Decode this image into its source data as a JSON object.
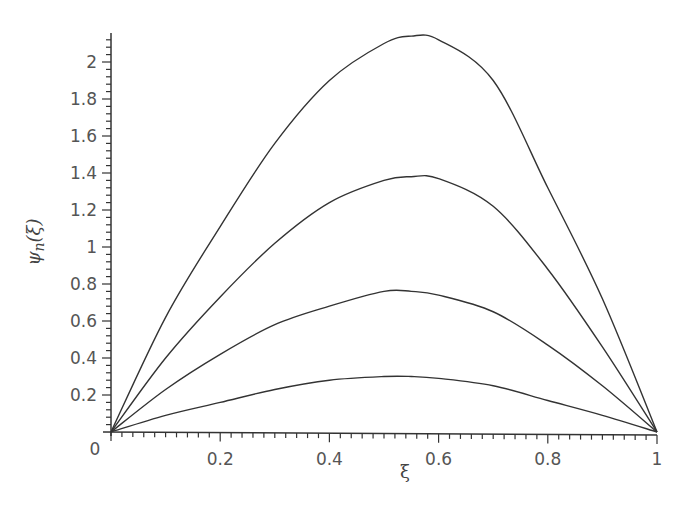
{
  "chart_data": {
    "type": "line",
    "title": "",
    "xlabel": "ξ",
    "ylabel": "ψn(ξ)",
    "xlim": [
      0,
      1
    ],
    "ylim": [
      0,
      2.2
    ],
    "grid": false,
    "legend": null,
    "x_ticks": [
      0,
      0.2,
      0.4,
      0.6,
      0.8,
      1
    ],
    "x_tick_labels": [
      "0",
      "0.2",
      "0.4",
      "0.6",
      "0.8",
      "1"
    ],
    "y_ticks": [
      0.2,
      0.4,
      0.6,
      0.8,
      1,
      1.2,
      1.4,
      1.6,
      1.8,
      2
    ],
    "y_tick_labels": [
      "0.2",
      "0.4",
      "0.6",
      "0.8",
      "1",
      "1.2",
      "1.4",
      "1.6",
      "1.8",
      "2"
    ],
    "x": [
      0,
      0.1,
      0.2,
      0.3,
      0.4,
      0.5,
      0.55,
      0.6,
      0.7,
      0.8,
      0.9,
      1.0
    ],
    "series": [
      {
        "name": "curve-1",
        "values": [
          0,
          0.62,
          1.11,
          1.56,
          1.9,
          2.1,
          2.14,
          2.12,
          1.9,
          1.32,
          0.72,
          0
        ]
      },
      {
        "name": "curve-2",
        "values": [
          0,
          0.4,
          0.73,
          1.02,
          1.24,
          1.36,
          1.38,
          1.37,
          1.22,
          0.88,
          0.46,
          0
        ]
      },
      {
        "name": "curve-3",
        "values": [
          0,
          0.23,
          0.42,
          0.58,
          0.68,
          0.76,
          0.76,
          0.74,
          0.65,
          0.47,
          0.25,
          0
        ]
      },
      {
        "name": "curve-4",
        "values": [
          0,
          0.09,
          0.16,
          0.23,
          0.28,
          0.3,
          0.3,
          0.29,
          0.25,
          0.17,
          0.09,
          0
        ]
      }
    ],
    "line_color": "#333333"
  }
}
